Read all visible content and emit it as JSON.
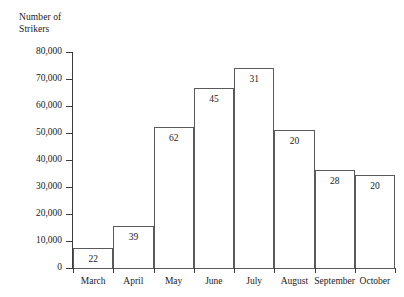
{
  "chart_data": {
    "type": "bar",
    "title": "",
    "ylabel": "Number of\nStrikers",
    "xlabel": "",
    "categories": [
      "March",
      "April",
      "May",
      "June",
      "July",
      "August",
      "September",
      "October"
    ],
    "values": [
      7400,
      15500,
      52200,
      66700,
      74000,
      51100,
      36300,
      34400
    ],
    "bar_labels": [
      "22",
      "39",
      "62",
      "45",
      "31",
      "20",
      "28",
      "20"
    ],
    "ylim": [
      0,
      80000
    ],
    "ytick_values": [
      0,
      10000,
      20000,
      30000,
      40000,
      50000,
      60000,
      70000,
      80000
    ],
    "ytick_labels": [
      "0",
      "10,000",
      "20,000",
      "30,000",
      "40,000",
      "50,000",
      "60,000",
      "70,000",
      "80,000"
    ],
    "grid": false,
    "legend": false,
    "bar_fill_color": "#ffffff",
    "bar_border_color": "#5a5a5a",
    "axis_color": "#3b3b3b",
    "text_color": "#1a1a1a",
    "background_color": "#ffffff"
  }
}
